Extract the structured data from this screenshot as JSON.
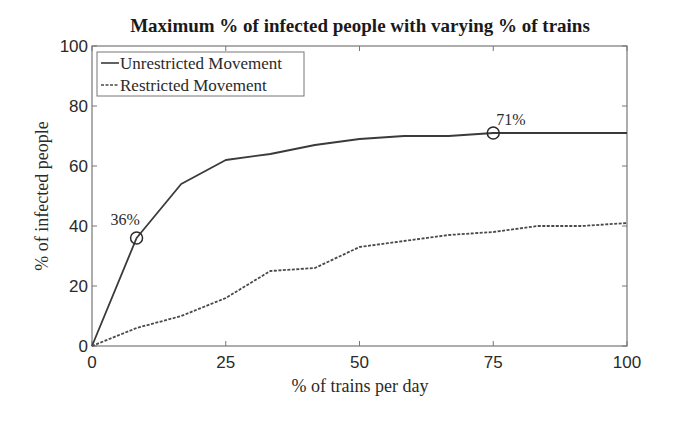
{
  "chart_data": {
    "type": "line",
    "title": "Maximum % of infected people with varying % of trains",
    "xlabel": "% of trains per day",
    "ylabel": "% of infected people",
    "xlim": [
      0,
      100
    ],
    "ylim": [
      0,
      100
    ],
    "xticks": [
      0,
      25,
      50,
      75,
      100
    ],
    "yticks": [
      0,
      20,
      40,
      60,
      80,
      100
    ],
    "grid": false,
    "legend_position": "upper-left",
    "x": [
      0,
      8.33,
      16.67,
      25,
      33.33,
      41.67,
      50,
      58.33,
      66.67,
      75,
      83.33,
      91.67,
      100
    ],
    "series": [
      {
        "name": "Unrestricted Movement",
        "style": "solid",
        "color": "#3a3a3a",
        "values": [
          0,
          36,
          54,
          62,
          64,
          67,
          69,
          70,
          70,
          71,
          71,
          71,
          71
        ]
      },
      {
        "name": "Restricted Movement",
        "style": "dashed",
        "color": "#4a4a4a",
        "values": [
          0,
          6,
          10,
          16,
          25,
          26,
          33,
          35,
          37,
          38,
          40,
          40,
          41
        ]
      }
    ],
    "annotations": [
      {
        "text": "36%",
        "x": 8.33,
        "y": 36,
        "marker": "circle",
        "series": "Unrestricted Movement"
      },
      {
        "text": "71%",
        "x": 75,
        "y": 71,
        "marker": "circle",
        "series": "Unrestricted Movement"
      }
    ]
  },
  "colors": {
    "frame": "#777777",
    "text": "#2a2a2a",
    "background": "#ffffff"
  }
}
